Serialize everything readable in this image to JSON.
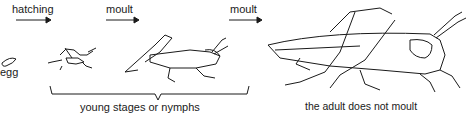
{
  "diagram": {
    "stages": [
      {
        "id": "egg",
        "label": "egg"
      },
      {
        "id": "nymph-small",
        "label": ""
      },
      {
        "id": "nymph-large",
        "label": ""
      },
      {
        "id": "adult",
        "label": "the adult does not moult"
      }
    ],
    "transitions": [
      {
        "from": "egg",
        "to": "nymph-small",
        "label": "hatching"
      },
      {
        "from": "nymph-small",
        "to": "nymph-large",
        "label": "moult"
      },
      {
        "from": "nymph-large",
        "to": "adult",
        "label": "moult"
      }
    ],
    "group_label": "young stages or nymphs",
    "colors": {
      "ink": "#1a1a1a",
      "background": "#ffffff"
    }
  }
}
